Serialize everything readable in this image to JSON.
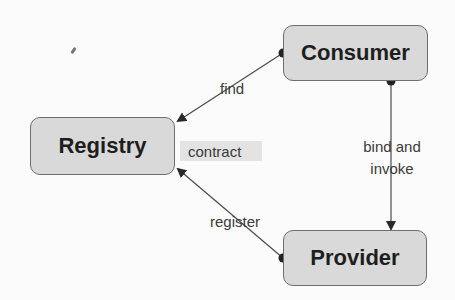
{
  "diagram": {
    "type": "service-oriented-architecture-triangle",
    "nodes": [
      {
        "id": "consumer",
        "label": "Consumer"
      },
      {
        "id": "registry",
        "label": "Registry"
      },
      {
        "id": "provider",
        "label": "Provider"
      }
    ],
    "edges": [
      {
        "from": "consumer",
        "to": "registry",
        "label": "find"
      },
      {
        "from": "provider",
        "to": "registry",
        "label": "register"
      },
      {
        "from": "consumer",
        "to": "provider",
        "label_line1": "bind and",
        "label_line2": "invoke"
      }
    ],
    "annotation": {
      "label": "contract"
    },
    "colors": {
      "node_fill": "#d9d9d9",
      "node_border": "#6e6e6e",
      "edge": "#3c3c3c",
      "annotation_bg": "#e3e3e3",
      "background": "#fbfbfb"
    }
  }
}
